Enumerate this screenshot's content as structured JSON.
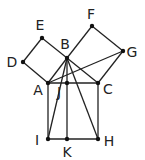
{
  "diagram": {
    "colors": {
      "stroke": "#222222",
      "point": "#111111",
      "label": "#222222",
      "background": "#ffffff"
    },
    "points": [
      {
        "name": "A",
        "x": 48,
        "y": 83,
        "label_x": 38,
        "label_y": 95
      },
      {
        "name": "B",
        "x": 67,
        "y": 58,
        "label_x": 65,
        "label_y": 49
      },
      {
        "name": "C",
        "x": 98,
        "y": 83,
        "label_x": 108,
        "label_y": 94
      },
      {
        "name": "D",
        "x": 23,
        "y": 62,
        "label_x": 12,
        "label_y": 67
      },
      {
        "name": "E",
        "x": 42,
        "y": 38,
        "label_x": 40,
        "label_y": 30
      },
      {
        "name": "F",
        "x": 92,
        "y": 26,
        "label_x": 91,
        "label_y": 19
      },
      {
        "name": "G",
        "x": 123,
        "y": 51,
        "label_x": 132,
        "label_y": 57
      },
      {
        "name": "H",
        "x": 98,
        "y": 139,
        "label_x": 109,
        "label_y": 146
      },
      {
        "name": "I",
        "x": 48,
        "y": 139,
        "label_x": 37,
        "label_y": 145
      },
      {
        "name": "J",
        "x": 67,
        "y": 83,
        "label_x": 59,
        "label_y": 97
      },
      {
        "name": "K",
        "x": 67,
        "y": 139,
        "label_x": 67,
        "label_y": 157
      }
    ],
    "segments": [
      [
        "A",
        "B"
      ],
      [
        "B",
        "C"
      ],
      [
        "A",
        "C"
      ],
      [
        "A",
        "D"
      ],
      [
        "D",
        "E"
      ],
      [
        "E",
        "B"
      ],
      [
        "B",
        "F"
      ],
      [
        "F",
        "G"
      ],
      [
        "G",
        "C"
      ],
      [
        "A",
        "I"
      ],
      [
        "I",
        "H"
      ],
      [
        "H",
        "C"
      ],
      [
        "B",
        "J"
      ],
      [
        "J",
        "K"
      ],
      [
        "A",
        "G"
      ],
      [
        "B",
        "H"
      ],
      [
        "B",
        "I"
      ]
    ],
    "labels": {
      "A": "A",
      "B": "B",
      "C": "C",
      "D": "D",
      "E": "E",
      "F": "F",
      "G": "G",
      "H": "H",
      "I": "I",
      "J": "J",
      "K": "K"
    }
  }
}
